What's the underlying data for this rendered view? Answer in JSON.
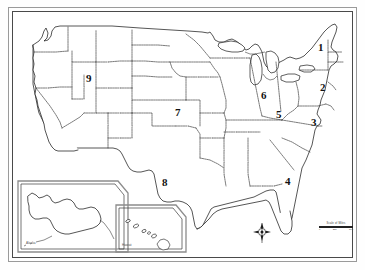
{
  "document": {
    "title": "United States Blank Outline Map",
    "type": "map",
    "orientation": "landscape",
    "colors": {
      "paper": "#fefefe",
      "ink": "#1a1a1a",
      "frame_outer": "#9a9a9a",
      "frame_inner": "#4a4a4a",
      "boundary": "#2b2b2b"
    }
  },
  "map": {
    "region": "United States of America",
    "projection_note": "conterminous United States with Alaska and Hawaii insets",
    "boundary_style": "dashed state borders, solid coastline",
    "labels": [
      {
        "id": "1",
        "text": "1",
        "x": 318,
        "y": 47,
        "target": "Maine / New England"
      },
      {
        "id": "2",
        "text": "2",
        "x": 321,
        "y": 87,
        "target": "Pennsylvania"
      },
      {
        "id": "3",
        "text": "3",
        "x": 312,
        "y": 122,
        "target": "Virginia"
      },
      {
        "id": "4",
        "text": "4",
        "x": 286,
        "y": 181,
        "target": "Georgia"
      },
      {
        "id": "5",
        "text": "5",
        "x": 277,
        "y": 114,
        "target": "Indiana"
      },
      {
        "id": "6",
        "text": "6",
        "x": 262,
        "y": 95,
        "target": "Michigan"
      },
      {
        "id": "7",
        "text": "7",
        "x": 176,
        "y": 112,
        "target": "Nebraska"
      },
      {
        "id": "8",
        "text": "8",
        "x": 163,
        "y": 182,
        "target": "Texas"
      },
      {
        "id": "9",
        "text": "9",
        "x": 87,
        "y": 78,
        "target": "Idaho"
      }
    ],
    "insets": [
      {
        "name": "alaska-inset",
        "label": "Alaska"
      },
      {
        "name": "hawaii-inset",
        "label": "Hawaii"
      }
    ],
    "compass": {
      "name": "compass-rose",
      "direction": "N"
    },
    "scalebar": {
      "title": "Scale of Miles",
      "ticks": [
        "0",
        "250",
        "500"
      ]
    }
  }
}
